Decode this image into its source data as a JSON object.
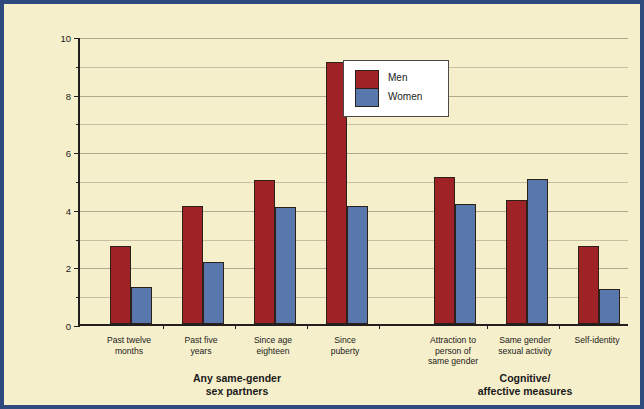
{
  "chart_data": {
    "type": "bar",
    "title": "",
    "xlabel": "",
    "ylabel": "Percent of Total NHSLS Sample",
    "ylim": [
      0,
      10
    ],
    "yticks": [
      0,
      2,
      4,
      6,
      8,
      10
    ],
    "ytick_labels": [
      "0",
      "2",
      "4",
      "6",
      "8",
      "10"
    ],
    "minor_yticks": [
      1,
      3,
      5,
      7,
      9
    ],
    "grid": true,
    "legend_position": "upper center",
    "categories": [
      "Past twelve\nmonths",
      "Past five\nyears",
      "Since age\neighteen",
      "Since\npuberty",
      "Attraction to\nperson of\nsame gender",
      "Same gender\nsexual activity",
      "Self-identity"
    ],
    "series": [
      {
        "name": "Men",
        "color": "#9e2226",
        "values": [
          2.7,
          4.1,
          5.0,
          9.1,
          5.1,
          4.3,
          2.7
        ]
      },
      {
        "name": "Women",
        "color": "#5878ad",
        "values": [
          1.3,
          2.15,
          4.05,
          4.1,
          4.15,
          5.05,
          1.2
        ]
      }
    ],
    "groups": [
      {
        "label": "Any same-gender\nsex partners",
        "categories": [
          0,
          1,
          2,
          3
        ]
      },
      {
        "label": "Cognitive/\naffective measures",
        "categories": [
          4,
          5,
          6
        ]
      }
    ]
  },
  "figure": {
    "background_color": "#f6efcb",
    "border_color": "#2f4a7c",
    "axis_color": "#231f20",
    "grid_color": "#c9bfa0"
  }
}
